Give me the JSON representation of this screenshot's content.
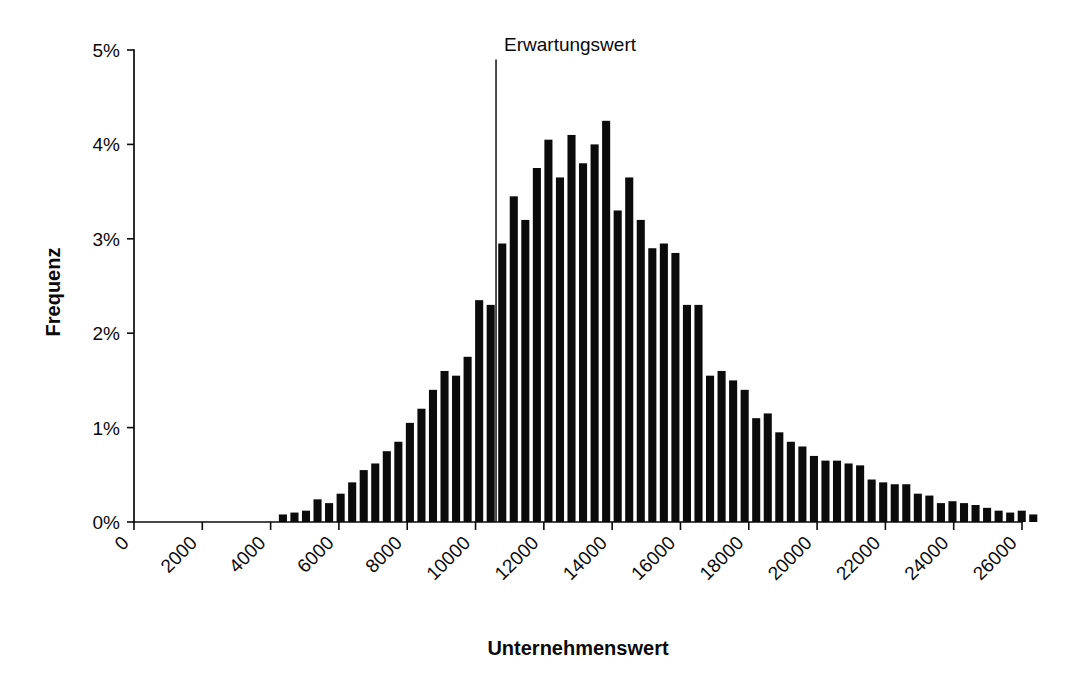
{
  "figure": {
    "background_color": "#ffffff",
    "ink_color": "#0b0b0b",
    "width": 1079,
    "height": 697
  },
  "chart_data": {
    "type": "bar",
    "title": "",
    "subtitle": "",
    "xlabel": "Unternehmenswert",
    "ylabel": "Frequenz",
    "xlim": [
      0,
      26800
    ],
    "ylim": [
      0,
      5
    ],
    "grid": false,
    "legend": null,
    "y_unit": "%",
    "y_tick_labels": [
      "0%",
      "1%",
      "2%",
      "3%",
      "4%",
      "5%"
    ],
    "y_tick_values": [
      0,
      1,
      2,
      3,
      4,
      5
    ],
    "x_tick_labels": [
      "0",
      "2000",
      "4000",
      "6000",
      "8000",
      "10000",
      "12000",
      "14000",
      "16000",
      "18000",
      "20000",
      "22000",
      "24000",
      "26000"
    ],
    "x_tick_values": [
      0,
      2000,
      4000,
      6000,
      8000,
      10000,
      12000,
      14000,
      16000,
      18000,
      20000,
      22000,
      24000,
      26000
    ],
    "x_tick_label_rotation": 45,
    "bin_width": 338,
    "bin_centers": [
      4360,
      4698,
      5036,
      5374,
      5712,
      6050,
      6388,
      6726,
      7064,
      7402,
      7740,
      8078,
      8416,
      8754,
      9092,
      9430,
      9768,
      10106,
      10444,
      10782,
      11120,
      11458,
      11796,
      12134,
      12472,
      12810,
      13148,
      13486,
      13824,
      14162,
      14500,
      14838,
      15176,
      15514,
      15852,
      16190,
      16528,
      16866,
      17204,
      17542,
      17880,
      18218,
      18556,
      18894,
      19232,
      19570,
      19908,
      20246,
      20584,
      20922,
      21260,
      21598,
      21936,
      22274,
      22612,
      22950,
      23288,
      23626,
      23964,
      24302,
      24640,
      24978,
      25316,
      25654,
      25992,
      26330
    ],
    "values": [
      0.08,
      0.1,
      0.12,
      0.24,
      0.2,
      0.3,
      0.42,
      0.55,
      0.62,
      0.75,
      0.85,
      1.05,
      1.2,
      1.4,
      1.6,
      1.55,
      1.75,
      2.35,
      2.3,
      2.95,
      3.45,
      3.2,
      3.75,
      4.05,
      3.65,
      4.1,
      3.8,
      4.0,
      4.25,
      3.3,
      3.65,
      3.2,
      2.9,
      2.95,
      2.85,
      2.3,
      2.3,
      1.55,
      1.6,
      1.5,
      1.4,
      1.1,
      1.15,
      0.95,
      0.85,
      0.8,
      0.7,
      0.65,
      0.65,
      0.62,
      0.6,
      0.45,
      0.42,
      0.4,
      0.4,
      0.3,
      0.28,
      0.2,
      0.22,
      0.2,
      0.18,
      0.15,
      0.12,
      0.1,
      0.12,
      0.08
    ],
    "bar_color": "#0b0b0b",
    "annotations": [
      {
        "name": "expected-value-marker",
        "label": "Erwartungswert",
        "x_value": 10600,
        "line_top_percent": 4.9,
        "line_bottom_percent": 0.0
      }
    ]
  }
}
